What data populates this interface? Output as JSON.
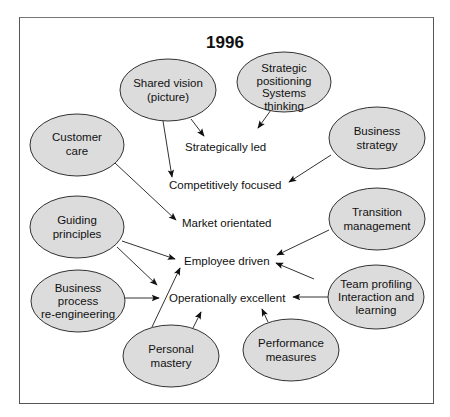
{
  "diagram": {
    "title": "1996",
    "nodes": [
      {
        "id": "shared-vision",
        "lines": [
          "Shared vision",
          "(picture)"
        ]
      },
      {
        "id": "strategic-positioning",
        "lines": [
          "Strategic",
          "positioning",
          "Systems",
          "thinking"
        ]
      },
      {
        "id": "customer-care",
        "lines": [
          "Customer",
          "care"
        ]
      },
      {
        "id": "business-strategy",
        "lines": [
          "Business",
          "strategy"
        ]
      },
      {
        "id": "guiding-principles",
        "lines": [
          "Guiding",
          "principles"
        ]
      },
      {
        "id": "transition-management",
        "lines": [
          "Transition",
          "management"
        ]
      },
      {
        "id": "business-process",
        "lines": [
          "Business",
          "process",
          "re-engineering"
        ]
      },
      {
        "id": "team-profiling",
        "lines": [
          "Team profiling",
          "Interaction and",
          "learning"
        ]
      },
      {
        "id": "personal-mastery",
        "lines": [
          "Personal",
          "mastery"
        ]
      },
      {
        "id": "performance-measures",
        "lines": [
          "Performance",
          "measures"
        ]
      }
    ],
    "outcomes": [
      {
        "id": "strategically-led",
        "label": "Strategically led"
      },
      {
        "id": "competitively-focused",
        "label": "Competitively focused"
      },
      {
        "id": "market-orientated",
        "label": "Market orientated"
      },
      {
        "id": "employee-driven",
        "label": "Employee driven"
      },
      {
        "id": "operationally-excellent",
        "label": "Operationally excellent"
      }
    ],
    "edges": [
      {
        "from": "shared-vision",
        "to": "strategically-led"
      },
      {
        "from": "shared-vision",
        "to": "competitively-focused"
      },
      {
        "from": "strategic-positioning",
        "to": "strategically-led"
      },
      {
        "from": "business-strategy",
        "to": "competitively-focused"
      },
      {
        "from": "customer-care",
        "to": "market-orientated"
      },
      {
        "from": "guiding-principles",
        "to": "employee-driven"
      },
      {
        "from": "guiding-principles",
        "to": "operationally-excellent"
      },
      {
        "from": "transition-management",
        "to": "employee-driven"
      },
      {
        "from": "team-profiling",
        "to": "employee-driven"
      },
      {
        "from": "team-profiling",
        "to": "operationally-excellent"
      },
      {
        "from": "business-process",
        "to": "operationally-excellent"
      },
      {
        "from": "personal-mastery",
        "to": "employee-driven"
      },
      {
        "from": "personal-mastery",
        "to": "operationally-excellent"
      },
      {
        "from": "performance-measures",
        "to": "operationally-excellent"
      }
    ],
    "colors": {
      "node_fill": "#dcdcdc",
      "stroke": "#333333",
      "frame": "#555555"
    }
  }
}
